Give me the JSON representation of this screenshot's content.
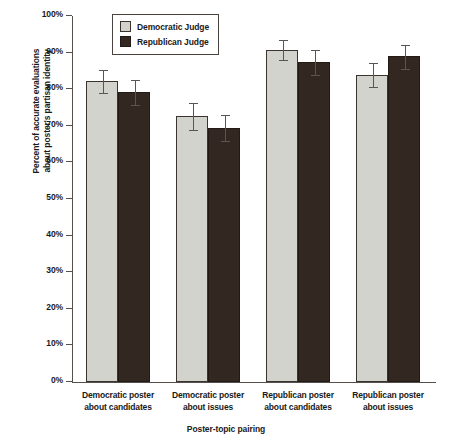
{
  "chart_data": {
    "type": "bar",
    "title": "",
    "xlabel": "Poster-topic pairing",
    "ylabel": "Percent of accurate evaluations about poster's partisan identity",
    "ylabel_line1": "Percent of accurate evaluations",
    "ylabel_line2": "about poster's partisan identity",
    "ylim": [
      0,
      100
    ],
    "grid": false,
    "legend_position": "top-center",
    "ytick_labels": [
      "100%",
      "90%",
      "80%",
      "70%",
      "60%",
      "50%",
      "40%",
      "30%",
      "20%",
      "10%",
      "0%"
    ],
    "ytick_values": [
      100,
      90,
      80,
      70,
      60,
      50,
      40,
      30,
      20,
      10,
      0
    ],
    "categories": [
      "Democratic poster about candidates",
      "Democratic poster about issues",
      "Republican poster about candidates",
      "Republican poster about issues"
    ],
    "category_lines": [
      [
        "Democratic poster",
        "about candidates"
      ],
      [
        "Democratic poster",
        "about issues"
      ],
      [
        "Republican poster",
        "about candidates"
      ],
      [
        "Republican poster",
        "about issues"
      ]
    ],
    "series": [
      {
        "name": "Democratic Judge",
        "color": "#d3d3ce",
        "values": [
          82.3,
          72.6,
          90.8,
          84.0
        ],
        "err_low": [
          3.2,
          3.8,
          2.8,
          3.5
        ],
        "err_high": [
          3.2,
          3.8,
          2.8,
          3.5
        ]
      },
      {
        "name": "Republican Judge",
        "color": "#332722",
        "values": [
          79.3,
          69.5,
          87.4,
          89.0
        ],
        "err_low": [
          3.5,
          3.6,
          3.6,
          3.4
        ],
        "err_high": [
          3.5,
          3.6,
          3.6,
          3.4
        ]
      }
    ]
  },
  "legend": {
    "items": [
      {
        "label": "Democratic Judge",
        "swatch": "light-gray-swatch"
      },
      {
        "label": "Republican Judge",
        "swatch": "dark-swatch"
      }
    ]
  },
  "colors": {
    "democratic_bar": "#d3d3ce",
    "republican_bar": "#332722",
    "axis": "#55504c",
    "text": "#1a1a1a",
    "background": "#ffffff"
  }
}
